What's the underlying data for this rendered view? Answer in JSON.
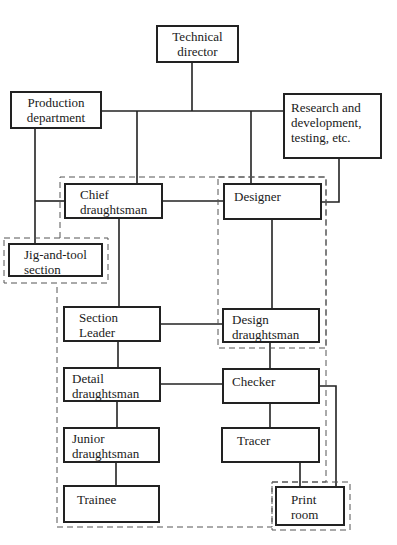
{
  "diagram": {
    "type": "organization-chart",
    "nodes": {
      "technical_director": {
        "lines": [
          "Technical",
          "director"
        ]
      },
      "production": {
        "lines": [
          "Production",
          "department"
        ]
      },
      "research": {
        "lines": [
          "Research and",
          "development,",
          "testing, etc."
        ]
      },
      "chief": {
        "lines": [
          "Chief",
          "draughtsman"
        ],
        "checked": true
      },
      "designer": {
        "lines": [
          "Designer"
        ],
        "checked": true
      },
      "jig": {
        "lines": [
          "Jig-and-tool",
          "section"
        ]
      },
      "section_leader": {
        "lines": [
          "Section",
          "Leader"
        ],
        "checked": true
      },
      "design_draughtsman": {
        "lines": [
          "Design",
          "draughtsman"
        ],
        "checked": true
      },
      "detail": {
        "lines": [
          "Detail",
          "draughtsman"
        ],
        "checked": true
      },
      "checker": {
        "lines": [
          "Checker"
        ],
        "checked": true
      },
      "junior": {
        "lines": [
          "Junior",
          "draughtsman"
        ]
      },
      "tracer": {
        "lines": [
          "Tracer"
        ],
        "checked": true
      },
      "trainee": {
        "lines": [
          "Trainee"
        ]
      },
      "print_room": {
        "lines": [
          "Print",
          "room"
        ]
      }
    },
    "edges": [
      [
        "technical_director",
        "production"
      ],
      [
        "technical_director",
        "research"
      ],
      [
        "technical_director",
        "chief"
      ],
      [
        "technical_director",
        "designer"
      ],
      [
        "production",
        "chief"
      ],
      [
        "production",
        "jig"
      ],
      [
        "research",
        "designer"
      ],
      [
        "chief",
        "designer"
      ],
      [
        "chief",
        "section_leader"
      ],
      [
        "designer",
        "design_draughtsman"
      ],
      [
        "section_leader",
        "design_draughtsman"
      ],
      [
        "section_leader",
        "detail"
      ],
      [
        "design_draughtsman",
        "checker"
      ],
      [
        "detail",
        "checker"
      ],
      [
        "detail",
        "junior"
      ],
      [
        "checker",
        "tracer"
      ],
      [
        "checker",
        "print_room"
      ],
      [
        "junior",
        "trainee"
      ],
      [
        "tracer",
        "print_room"
      ]
    ],
    "dashed_groups": [
      "drawing-office",
      "design-group",
      "jig-and-tool-group",
      "print-room-group"
    ]
  }
}
